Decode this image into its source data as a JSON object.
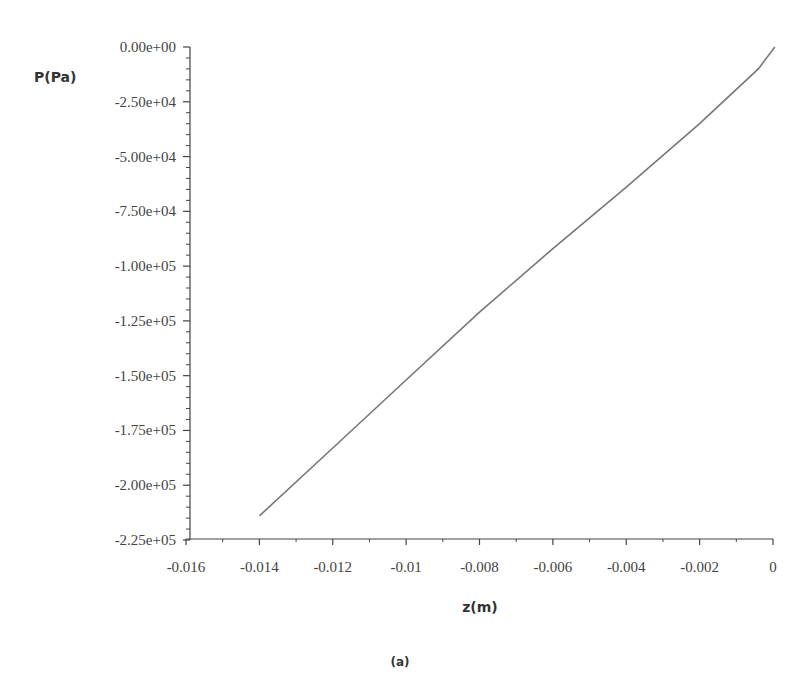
{
  "chart_data": {
    "type": "line",
    "title": "",
    "xlabel": "z(m)",
    "ylabel": "P(Pa)",
    "caption": "(a)",
    "xlim": [
      -0.016,
      0
    ],
    "ylim": [
      -225000,
      0
    ],
    "xticks": [
      -0.016,
      -0.014,
      -0.012,
      -0.01,
      -0.008,
      -0.006,
      -0.004,
      -0.002,
      0
    ],
    "xtick_labels": [
      "-0.016",
      "-0.014",
      "-0.012",
      "-0.01",
      "-0.008",
      "-0.006",
      "-0.004",
      "-0.002",
      "0"
    ],
    "yticks": [
      0,
      -25000,
      -50000,
      -75000,
      -100000,
      -125000,
      -150000,
      -175000,
      -200000,
      -225000
    ],
    "ytick_labels": [
      "0.00e+00",
      "-2.50e+04",
      "-5.00e+04",
      "-7.50e+04",
      "-1.00e+05",
      "-1.25e+05",
      "-1.50e+05",
      "-1.75e+05",
      "-2.00e+05",
      "-2.25e+05"
    ],
    "grid": false,
    "legend": null,
    "series": [
      {
        "name": "P",
        "color": "#777777",
        "x": [
          -0.014,
          -0.012,
          -0.01,
          -0.008,
          -0.006,
          -0.004,
          -0.002,
          -0.0004,
          5e-05
        ],
        "y": [
          -214000,
          -183000,
          -152000,
          -121000,
          -92000,
          -64000,
          -35000,
          -10000,
          0
        ]
      }
    ]
  }
}
